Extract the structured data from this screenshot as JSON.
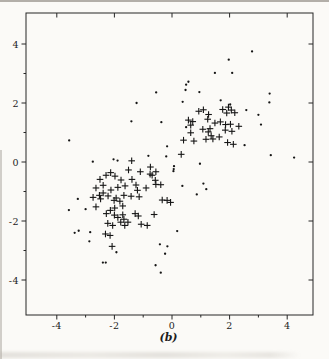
{
  "figure_label": "(b)",
  "colors": {
    "ink": "#151515",
    "axis": "#262626",
    "paper": "#fbfaf7"
  },
  "axes": {
    "x": {
      "min": -5,
      "max": 5,
      "major": [
        -4,
        -2,
        0,
        2,
        4
      ],
      "minor": [
        -3,
        -1,
        1,
        3
      ],
      "labels": [
        "-4",
        "-2",
        "0",
        "2",
        "4"
      ]
    },
    "y": {
      "min": -5,
      "max": 5,
      "major": [
        -4,
        -2,
        0,
        2,
        4
      ],
      "minor": [
        -3,
        -1,
        1,
        3
      ],
      "labels": [
        "-4",
        "-2",
        "0",
        "2",
        "4"
      ]
    }
  },
  "chart_data": {
    "type": "scatter",
    "title": "",
    "xlabel": "",
    "ylabel": "",
    "xlim": [
      -5,
      5
    ],
    "ylim": [
      -5,
      5
    ],
    "grid": false,
    "legend": null,
    "caption": "(b)",
    "series": [
      {
        "name": "dot-class",
        "marker": "point",
        "points": [
          [
            2.78,
            3.75
          ],
          [
            1.97,
            3.47
          ],
          [
            2.09,
            3.02
          ],
          [
            1.49,
            3.02
          ],
          [
            3.39,
            2.32
          ],
          [
            3.38,
            2.02
          ],
          [
            0.49,
            2.62
          ],
          [
            0.57,
            2.72
          ],
          [
            0.47,
            2.44
          ],
          [
            -0.55,
            2.36
          ],
          [
            0.95,
            2.37
          ],
          [
            -1.23,
            2.0
          ],
          [
            0.37,
            2.04
          ],
          [
            1.69,
            2.09
          ],
          [
            3.0,
            1.6
          ],
          [
            3.09,
            1.27
          ],
          [
            2.58,
            1.76
          ],
          [
            2.02,
            1.95
          ],
          [
            2.52,
            0.57
          ],
          [
            3.43,
            0.23
          ],
          [
            4.24,
            0.15
          ],
          [
            0.49,
            1.18
          ],
          [
            -0.37,
            1.35
          ],
          [
            -1.41,
            1.38
          ],
          [
            -0.17,
            0.53
          ],
          [
            -0.82,
            0.21
          ],
          [
            -0.2,
            0.19
          ],
          [
            0.07,
            -0.14
          ],
          [
            0.06,
            -0.24
          ],
          [
            0.05,
            -0.31
          ],
          [
            0.97,
            -0.06
          ],
          [
            1.09,
            -0.73
          ],
          [
            1.19,
            -0.92
          ],
          [
            0.36,
            -0.81
          ],
          [
            0.86,
            -1.1
          ],
          [
            -3.57,
            0.73
          ],
          [
            -2.75,
            0.01
          ],
          [
            -2.03,
            0.09
          ],
          [
            -1.89,
            0.05
          ],
          [
            -3.27,
            -1.25
          ],
          [
            -3.58,
            -1.63
          ],
          [
            -3.0,
            -1.6
          ],
          [
            -3.38,
            -2.4
          ],
          [
            -3.24,
            -2.33
          ],
          [
            -2.84,
            -2.38
          ],
          [
            -2.87,
            -2.69
          ],
          [
            -1.93,
            -3.06
          ],
          [
            -2.4,
            -3.41
          ],
          [
            -2.3,
            -3.41
          ],
          [
            0.18,
            -2.34
          ],
          [
            -0.42,
            -2.79
          ],
          [
            -0.16,
            -2.86
          ],
          [
            -0.24,
            -3.11
          ],
          [
            -0.57,
            -3.5
          ],
          [
            -0.39,
            -3.75
          ]
        ]
      },
      {
        "name": "plus-class",
        "marker": "plus",
        "points": [
          [
            0.93,
            1.72
          ],
          [
            1.09,
            1.77
          ],
          [
            1.27,
            1.61
          ],
          [
            1.76,
            1.78
          ],
          [
            1.96,
            1.86
          ],
          [
            2.06,
            1.76
          ],
          [
            1.9,
            1.66
          ],
          [
            2.18,
            1.67
          ],
          [
            0.57,
            1.42
          ],
          [
            0.72,
            1.37
          ],
          [
            0.65,
            1.25
          ],
          [
            1.24,
            1.45
          ],
          [
            1.49,
            1.32
          ],
          [
            1.68,
            1.36
          ],
          [
            1.86,
            1.27
          ],
          [
            2.03,
            1.28
          ],
          [
            2.32,
            1.21
          ],
          [
            1.07,
            1.11
          ],
          [
            1.32,
            1.13
          ],
          [
            1.85,
            1.08
          ],
          [
            2.08,
            1.04
          ],
          [
            0.65,
            0.99
          ],
          [
            1.26,
            1.02
          ],
          [
            1.36,
            0.89
          ],
          [
            1.64,
            0.85
          ],
          [
            1.18,
            0.77
          ],
          [
            1.42,
            0.78
          ],
          [
            1.93,
            0.66
          ],
          [
            2.13,
            0.6
          ],
          [
            0.4,
            0.74
          ],
          [
            0.76,
            0.71
          ],
          [
            0.32,
            0.26
          ],
          [
            -1.4,
            0.04
          ],
          [
            -1.51,
            -0.27
          ],
          [
            -2.13,
            -0.36
          ],
          [
            -1.1,
            -0.33
          ],
          [
            -0.75,
            -0.17
          ],
          [
            -0.56,
            -0.33
          ],
          [
            -2.5,
            -0.59
          ],
          [
            -2.29,
            -0.45
          ],
          [
            -1.98,
            -0.48
          ],
          [
            -1.77,
            -0.61
          ],
          [
            -1.39,
            -0.59
          ],
          [
            -0.76,
            -0.41
          ],
          [
            -0.69,
            -0.45
          ],
          [
            -0.58,
            -0.62
          ],
          [
            -0.56,
            -0.76
          ],
          [
            -0.39,
            -0.77
          ],
          [
            -2.64,
            -0.88
          ],
          [
            -2.39,
            -0.79
          ],
          [
            -2.39,
            -1.05
          ],
          [
            -2.12,
            -0.95
          ],
          [
            -1.88,
            -0.86
          ],
          [
            -1.63,
            -0.81
          ],
          [
            -1.25,
            -0.78
          ],
          [
            -0.9,
            -0.88
          ],
          [
            -2.52,
            -1.13
          ],
          [
            -2.22,
            -1.15
          ],
          [
            -1.94,
            -1.22
          ],
          [
            -1.67,
            -1.13
          ],
          [
            -1.42,
            -1.16
          ],
          [
            -1.2,
            -0.96
          ],
          [
            -1.14,
            -1.18
          ],
          [
            -0.34,
            -1.29
          ],
          [
            -0.17,
            -1.3
          ],
          [
            -0.05,
            -1.37
          ],
          [
            -2.74,
            -1.2
          ],
          [
            -2.48,
            -1.25
          ],
          [
            -2.01,
            -1.3
          ],
          [
            -1.81,
            -1.33
          ],
          [
            -1.71,
            -1.49
          ],
          [
            -1.99,
            -1.56
          ],
          [
            -2.14,
            -1.64
          ],
          [
            -2.64,
            -1.52
          ],
          [
            -2.28,
            -1.75
          ],
          [
            -2.0,
            -1.8
          ],
          [
            -1.88,
            -1.88
          ],
          [
            -1.71,
            -1.79
          ],
          [
            -2.23,
            -2.08
          ],
          [
            -2.06,
            -2.15
          ],
          [
            -1.78,
            -2.04
          ],
          [
            -2.31,
            -2.44
          ],
          [
            -2.15,
            -2.49
          ],
          [
            -2.08,
            -2.86
          ],
          [
            -1.28,
            -1.75
          ],
          [
            -1.17,
            -1.83
          ],
          [
            -0.62,
            -1.78
          ],
          [
            -1.67,
            -1.94
          ],
          [
            -1.53,
            -2.04
          ],
          [
            -1.64,
            -2.15
          ],
          [
            -1.07,
            -2.11
          ],
          [
            -0.86,
            -2.15
          ]
        ]
      }
    ]
  }
}
